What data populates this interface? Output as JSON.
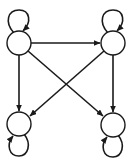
{
  "diagram": {
    "type": "directed-graph",
    "colors": {
      "stroke": "#1a1a1a",
      "node_fill": "#ffffff",
      "background": "#ffffff"
    },
    "nodes": [
      {
        "id": "top-left",
        "label": "",
        "cx": 19,
        "cy": 43,
        "r": 12,
        "self_loop": "above"
      },
      {
        "id": "top-right",
        "label": "",
        "cx": 113,
        "cy": 43,
        "r": 12,
        "self_loop": "above"
      },
      {
        "id": "bottom-left",
        "label": "",
        "cx": 19,
        "cy": 124,
        "r": 12,
        "self_loop": "below"
      },
      {
        "id": "bottom-right",
        "label": "",
        "cx": 113,
        "cy": 125,
        "r": 12,
        "self_loop": "below"
      }
    ],
    "edges": [
      {
        "from": "top-left",
        "to": "top-left"
      },
      {
        "from": "top-right",
        "to": "top-right"
      },
      {
        "from": "bottom-left",
        "to": "bottom-left"
      },
      {
        "from": "bottom-right",
        "to": "bottom-right"
      },
      {
        "from": "top-left",
        "to": "top-right"
      },
      {
        "from": "top-left",
        "to": "bottom-left"
      },
      {
        "from": "top-left",
        "to": "bottom-right"
      },
      {
        "from": "top-right",
        "to": "bottom-left"
      },
      {
        "from": "top-right",
        "to": "bottom-right"
      }
    ]
  }
}
